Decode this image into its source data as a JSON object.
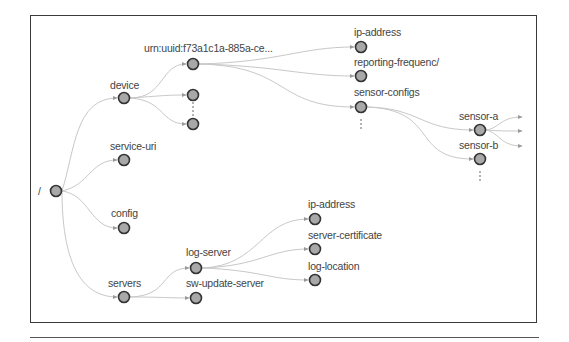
{
  "diagram": {
    "type": "tree",
    "colors": {
      "node_fill": "#a8a8a8",
      "node_stroke": "#333333",
      "edge": "#c8c8c8",
      "label": "#444444",
      "frame": "#3a3a3a"
    },
    "root": {
      "label": "/"
    },
    "nodes": {
      "root": "/",
      "device": "device",
      "service_uri": "service-uri",
      "config": "config",
      "servers": "servers",
      "device_uuid": "urn:uuid:f73a1c1a-885a-ce...",
      "device_ip_address": "ip-address",
      "reporting_frequency": "reporting-frequenc/",
      "sensor_configs": "sensor-configs",
      "sensor_a": "sensor-a",
      "sensor_b": "sensor-b",
      "log_server": "log-server",
      "sw_update_server": "sw-update-server",
      "log_ip_address": "ip-address",
      "server_certificate": "server-certificate",
      "log_location": "log-location"
    },
    "ellipsis_markers": [
      "device-children",
      "sensor-configs-siblings",
      "sensor-b-siblings"
    ],
    "edges": [
      [
        "/",
        "device"
      ],
      [
        "/",
        "service-uri"
      ],
      [
        "/",
        "config"
      ],
      [
        "/",
        "servers"
      ],
      [
        "device",
        "urn:uuid:f73a1c1a-885a-ce..."
      ],
      [
        "device",
        "(unnamed child 2)"
      ],
      [
        "device",
        "(unnamed child 3)"
      ],
      [
        "urn:uuid:f73a1c1a-885a-ce...",
        "ip-address"
      ],
      [
        "urn:uuid:f73a1c1a-885a-ce...",
        "reporting-frequenc/"
      ],
      [
        "urn:uuid:f73a1c1a-885a-ce...",
        "sensor-configs"
      ],
      [
        "sensor-configs",
        "sensor-a"
      ],
      [
        "sensor-configs",
        "sensor-b"
      ],
      [
        "sensor-a",
        "(truncated x3)"
      ],
      [
        "servers",
        "log-server"
      ],
      [
        "servers",
        "sw-update-server"
      ],
      [
        "log-server",
        "ip-address"
      ],
      [
        "log-server",
        "server-certificate"
      ],
      [
        "log-server",
        "log-location"
      ]
    ]
  }
}
